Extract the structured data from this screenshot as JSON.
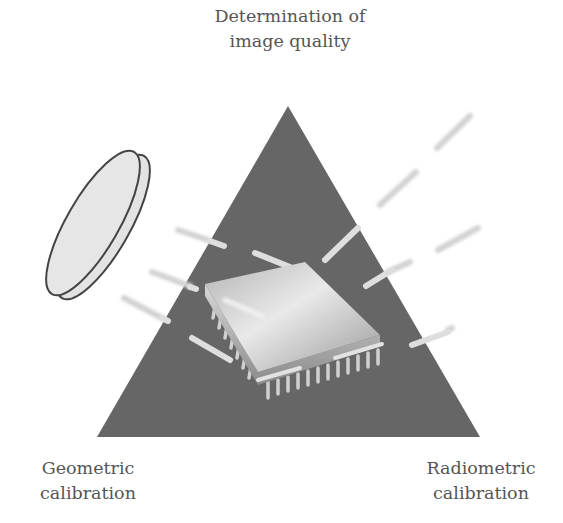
{
  "diagram": {
    "vertices": {
      "top": {
        "line1": "Determination of",
        "line2": "image quality"
      },
      "bottom_left": {
        "line1": "Geometric",
        "line2": "calibration"
      },
      "bottom_right": {
        "line1": "Radiometric",
        "line2": "calibration"
      }
    },
    "elements": [
      {
        "name": "triangle",
        "shape": "triangle",
        "fill": "#666666"
      },
      {
        "name": "lens",
        "shape": "tilted disc (optical lens)",
        "fill": "#e0e0e0",
        "stroke": "#444444"
      },
      {
        "name": "chip",
        "shape": "microchip (image sensor) with pins",
        "fill": "#cfcfcf"
      },
      {
        "name": "light-rays",
        "shape": "short light streaks",
        "fill": "#d8d8d8"
      }
    ],
    "colors": {
      "triangle": "#666666",
      "text": "#555555",
      "lens_fill": "#e2e2e2",
      "lens_stroke": "#444444",
      "ray": "#d6d6d6"
    }
  }
}
